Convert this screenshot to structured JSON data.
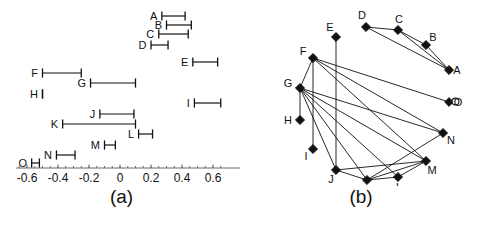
{
  "figure": {
    "panels": [
      {
        "id": "a",
        "caption": "(a)"
      },
      {
        "id": "b",
        "caption": "(b)"
      }
    ]
  },
  "chart_data": [
    {
      "type": "interval",
      "panel": "a",
      "title": "",
      "xlabel": "",
      "ylabel": "",
      "xlim": [
        -0.68,
        0.7
      ],
      "grid": false,
      "legend": "none",
      "axis_ticks": [
        {
          "value": -0.6,
          "label": "-0.6"
        },
        {
          "value": -0.4,
          "label": "-0.4"
        },
        {
          "value": -0.2,
          "label": "-0.2"
        },
        {
          "value": 0.0,
          "label": "0"
        },
        {
          "value": 0.2,
          "label": "0.2"
        },
        {
          "value": 0.4,
          "label": "0.4"
        },
        {
          "value": 0.6,
          "label": "0.6"
        }
      ],
      "minor_tick_step": 0.05,
      "categories": [
        "A",
        "B",
        "C",
        "D",
        "E",
        "F",
        "G",
        "H",
        "I",
        "J",
        "K",
        "L",
        "M",
        "N",
        "O"
      ],
      "intervals": [
        {
          "label": "A",
          "row": 0,
          "start": 0.27,
          "end": 0.42
        },
        {
          "label": "B",
          "row": 1,
          "start": 0.3,
          "end": 0.46
        },
        {
          "label": "C",
          "row": 2,
          "start": 0.25,
          "end": 0.44
        },
        {
          "label": "D",
          "row": 3,
          "start": 0.2,
          "end": 0.31
        },
        {
          "label": "E",
          "row": 4,
          "start": 0.47,
          "end": 0.63
        },
        {
          "label": "F",
          "row": 5,
          "start": -0.5,
          "end": -0.25
        },
        {
          "label": "G",
          "row": 6,
          "start": -0.19,
          "end": 0.1
        },
        {
          "label": "H",
          "row": 7,
          "start": -0.5,
          "end": -0.5
        },
        {
          "label": "I",
          "row": 8,
          "start": 0.48,
          "end": 0.65
        },
        {
          "label": "J",
          "row": 9,
          "start": -0.13,
          "end": 0.09
        },
        {
          "label": "K",
          "row": 10,
          "start": -0.37,
          "end": 0.1
        },
        {
          "label": "L",
          "row": 11,
          "start": 0.12,
          "end": 0.21
        },
        {
          "label": "M",
          "row": 12,
          "start": -0.1,
          "end": -0.03
        },
        {
          "label": "N",
          "row": 13,
          "start": -0.41,
          "end": -0.29
        },
        {
          "label": "O",
          "row": 14,
          "start": -0.57,
          "end": -0.52
        }
      ]
    },
    {
      "type": "graph",
      "panel": "b",
      "title": "",
      "legend": "none",
      "grid": false,
      "node_marker": "diamond",
      "nodes": [
        {
          "id": "A",
          "x": 206,
          "y": 70,
          "label": "A",
          "label_dx": 8,
          "label_dy": 4,
          "marker": "diamond"
        },
        {
          "id": "B",
          "x": 183,
          "y": 45,
          "label": "B",
          "label_dx": 7,
          "label_dy": -4,
          "marker": "diamond"
        },
        {
          "id": "C",
          "x": 155,
          "y": 30,
          "label": "C",
          "label_dx": 1,
          "label_dy": -7,
          "marker": "diamond"
        },
        {
          "id": "D",
          "x": 123,
          "y": 27,
          "label": "D",
          "label_dx": -4,
          "label_dy": -8,
          "marker": "diamond"
        },
        {
          "id": "E",
          "x": 93,
          "y": 37,
          "label": "E",
          "label_dx": -6,
          "label_dy": -6,
          "marker": "diamond"
        },
        {
          "id": "F",
          "x": 70,
          "y": 58,
          "label": "F",
          "label_dx": -10,
          "label_dy": -3,
          "marker": "diamond"
        },
        {
          "id": "G",
          "x": 57,
          "y": 88,
          "label": "G",
          "label_dx": -12,
          "label_dy": -1,
          "marker": "diamond"
        },
        {
          "id": "H",
          "x": 57,
          "y": 120,
          "label": "H",
          "label_dx": -12,
          "label_dy": 4,
          "marker": "diamond"
        },
        {
          "id": "I",
          "x": 70,
          "y": 149,
          "label": "I",
          "label_dx": -7,
          "label_dy": 11,
          "marker": "diamond"
        },
        {
          "id": "J",
          "x": 93,
          "y": 170,
          "label": "J",
          "label_dx": -5,
          "label_dy": 13,
          "marker": "diamond"
        },
        {
          "id": "K",
          "x": 124,
          "y": 180,
          "label": "K",
          "label_dx": -1,
          "label_dy": 14,
          "marker": "diamond"
        },
        {
          "id": "L",
          "x": 155,
          "y": 177,
          "label": "L",
          "label_dx": 1,
          "label_dy": 14,
          "marker": "diamond"
        },
        {
          "id": "M",
          "x": 183,
          "y": 161,
          "label": "M",
          "label_dx": 6,
          "label_dy": 13,
          "marker": "diamond"
        },
        {
          "id": "N",
          "x": 200,
          "y": 133,
          "label": "N",
          "label_dx": 8,
          "label_dy": 11,
          "marker": "diamond"
        },
        {
          "id": "O",
          "x": 206,
          "y": 102,
          "label": "O",
          "label_dx": 9,
          "label_dy": 4,
          "marker": "circle"
        }
      ],
      "edges": [
        {
          "from": "A",
          "to": "B"
        },
        {
          "from": "A",
          "to": "C"
        },
        {
          "from": "A",
          "to": "D"
        },
        {
          "from": "B",
          "to": "C"
        },
        {
          "from": "C",
          "to": "D"
        },
        {
          "from": "E",
          "to": "J"
        },
        {
          "from": "F",
          "to": "G"
        },
        {
          "from": "F",
          "to": "I"
        },
        {
          "from": "F",
          "to": "N"
        },
        {
          "from": "F",
          "to": "O"
        },
        {
          "from": "F",
          "to": "M"
        },
        {
          "from": "G",
          "to": "H"
        },
        {
          "from": "G",
          "to": "J"
        },
        {
          "from": "G",
          "to": "K"
        },
        {
          "from": "G",
          "to": "L"
        },
        {
          "from": "G",
          "to": "M"
        },
        {
          "from": "G",
          "to": "N"
        },
        {
          "from": "J",
          "to": "K"
        },
        {
          "from": "J",
          "to": "M"
        },
        {
          "from": "K",
          "to": "L"
        },
        {
          "from": "K",
          "to": "M"
        },
        {
          "from": "K",
          "to": "N"
        },
        {
          "from": "L",
          "to": "M"
        }
      ]
    }
  ],
  "colors": {
    "ink": "#111111",
    "axis": "#6b6b6b",
    "background": "#ffffff"
  }
}
